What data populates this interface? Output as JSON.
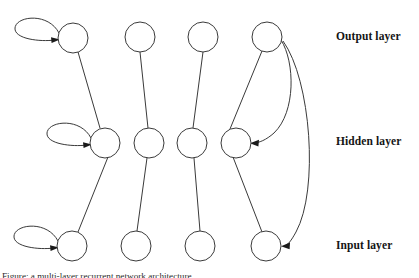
{
  "figure": {
    "kind": "recurrent-neural-network-layer-diagram",
    "background_color": "#ffffff",
    "stroke_color": "#3a3a3a",
    "arrow_color": "#1a1a1a",
    "label_color": "#151515",
    "caption": "Figure: a multi-layer recurrent network architecture"
  },
  "labels": {
    "output": "Output layer",
    "hidden": "Hidden layer",
    "input": "Input layer"
  },
  "layers": [
    {
      "id": "output",
      "label": "Output layer",
      "y": 38,
      "node_count": 4
    },
    {
      "id": "hidden",
      "label": "Hidden layer",
      "y": 142,
      "node_count": 4
    },
    {
      "id": "input",
      "label": "Input layer",
      "y": 245,
      "node_count": 4
    }
  ],
  "nodes": [
    {
      "id": "out-1",
      "layer": "output",
      "column": 1,
      "cx": 73,
      "cy": 38,
      "r": 15,
      "self_loop": true
    },
    {
      "id": "out-2",
      "layer": "output",
      "column": 2,
      "cx": 140,
      "cy": 37,
      "r": 15,
      "self_loop": false
    },
    {
      "id": "out-3",
      "layer": "output",
      "column": 3,
      "cx": 203,
      "cy": 37,
      "r": 15,
      "self_loop": false
    },
    {
      "id": "out-4",
      "layer": "output",
      "column": 4,
      "cx": 267,
      "cy": 37,
      "r": 15,
      "self_loop": false
    },
    {
      "id": "hid-1",
      "layer": "hidden",
      "column": 1,
      "cx": 105,
      "cy": 143,
      "r": 15,
      "self_loop": true
    },
    {
      "id": "hid-2",
      "layer": "hidden",
      "column": 2,
      "cx": 149,
      "cy": 143,
      "r": 15,
      "self_loop": false
    },
    {
      "id": "hid-3",
      "layer": "hidden",
      "column": 3,
      "cx": 192,
      "cy": 143,
      "r": 15,
      "self_loop": false
    },
    {
      "id": "hid-4",
      "layer": "hidden",
      "column": 4,
      "cx": 236,
      "cy": 143,
      "r": 15,
      "self_loop": false
    },
    {
      "id": "inp-1",
      "layer": "input",
      "column": 1,
      "cx": 72,
      "cy": 246,
      "r": 15,
      "self_loop": true
    },
    {
      "id": "inp-2",
      "layer": "input",
      "column": 2,
      "cx": 136,
      "cy": 246,
      "r": 15,
      "self_loop": false
    },
    {
      "id": "inp-3",
      "layer": "input",
      "column": 3,
      "cx": 200,
      "cy": 246,
      "r": 15,
      "self_loop": false
    },
    {
      "id": "inp-4",
      "layer": "input",
      "column": 4,
      "cx": 266,
      "cy": 246,
      "r": 15,
      "self_loop": false
    }
  ],
  "edges": [
    {
      "id": "e-out1-hid1",
      "from": "out-1",
      "to": "hid-1",
      "style": "straight",
      "arrow": false
    },
    {
      "id": "e-out2-hid2",
      "from": "out-2",
      "to": "hid-2",
      "style": "straight",
      "arrow": false
    },
    {
      "id": "e-out3-hid3",
      "from": "out-3",
      "to": "hid-3",
      "style": "straight",
      "arrow": false
    },
    {
      "id": "e-out4-hid4",
      "from": "out-4",
      "to": "hid-4",
      "style": "straight",
      "arrow": false
    },
    {
      "id": "e-hid1-inp1",
      "from": "hid-1",
      "to": "inp-1",
      "style": "straight",
      "arrow": false
    },
    {
      "id": "e-hid2-inp2",
      "from": "hid-2",
      "to": "inp-2",
      "style": "straight",
      "arrow": false
    },
    {
      "id": "e-hid3-inp3",
      "from": "hid-3",
      "to": "inp-3",
      "style": "straight",
      "arrow": false
    },
    {
      "id": "e-hid4-inp4",
      "from": "hid-4",
      "to": "inp-4",
      "style": "straight",
      "arrow": false
    }
  ],
  "feedback_edges": [
    {
      "id": "fb-out4-hid4",
      "from": "out-4",
      "to": "hid-4",
      "style": "curve",
      "arrow": true
    },
    {
      "id": "fb-out4-inp4",
      "from": "out-4",
      "to": "inp-4",
      "style": "curve",
      "arrow": true
    }
  ],
  "self_loops": [
    {
      "id": "loop-out1",
      "node": "out-1",
      "arrow": true
    },
    {
      "id": "loop-hid1",
      "node": "hid-1",
      "arrow": true
    },
    {
      "id": "loop-inp1",
      "node": "inp-1",
      "arrow": true
    }
  ]
}
